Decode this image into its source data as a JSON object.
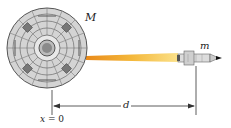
{
  "figure": {
    "labels": {
      "large_mass": "M",
      "small_mass": "m",
      "distance": "d",
      "origin_var": "x",
      "origin_eq": " = 0"
    },
    "objects": [
      {
        "name": "station-disk",
        "description": "large circular body of mass M centered at x = 0"
      },
      {
        "name": "rocket",
        "description": "small rocket of mass m at distance d"
      },
      {
        "name": "exhaust-plume",
        "description": "orange-yellow exhaust beam between the disk and the rocket"
      }
    ],
    "colors": {
      "disk_fill": "#cfcfcf",
      "disk_grid": "#6b6b6b",
      "plume": "#f2b233",
      "rocket_body": "#d8d8d8",
      "rocket_tip": "#111111",
      "lines": "#333333"
    }
  }
}
